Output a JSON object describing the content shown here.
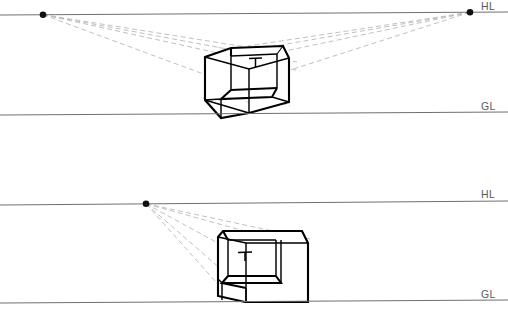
{
  "document": {
    "title": "Two-point and one-point perspective construction of a notched box",
    "background_color": "#ffffff",
    "width": 508,
    "height": 317
  },
  "style_colors": {
    "reference_line": "#6f6f6f",
    "construction_line": "#b9b9b9",
    "object_outline": "#000000",
    "vanishing_point": "#111111",
    "label_text": "#5a5a5a",
    "face_fill": "#ffffff"
  },
  "diagrams": [
    {
      "id": "two-point-perspective",
      "name": "Two-point perspective",
      "labels": {
        "horizon_line": "HL",
        "ground_line": "GL"
      },
      "horizon_line": {
        "x1": 0,
        "y1": 15,
        "x2": 508,
        "y2": 12
      },
      "ground_line": {
        "x1": 0,
        "y1": 115,
        "x2": 508,
        "y2": 112
      },
      "label_positions": {
        "horizon_line": {
          "x": 481,
          "y": 10
        },
        "ground_line": {
          "x": 481,
          "y": 110
        }
      },
      "vanishing_points": [
        {
          "name": "VPL",
          "x": 43,
          "y": 14.7
        },
        {
          "name": "VPR",
          "x": 470,
          "y": 12.3
        }
      ],
      "object": {
        "kind": "notched-box",
        "description": "Open cubic box with a rectangular notch removed from the lower front-left, drawn in two-point perspective",
        "interior_marker": "T-shaped scale figure on back wall"
      }
    },
    {
      "id": "one-point-perspective",
      "name": "One-point perspective",
      "labels": {
        "horizon_line": "HL",
        "ground_line": "GL"
      },
      "horizon_line": {
        "x1": 0,
        "y1": 205,
        "x2": 508,
        "y2": 201
      },
      "ground_line": {
        "x1": 0,
        "y1": 303,
        "x2": 508,
        "y2": 300
      },
      "label_positions": {
        "horizon_line": {
          "x": 481,
          "y": 198
        },
        "ground_line": {
          "x": 481,
          "y": 298
        }
      },
      "vanishing_points": [
        {
          "name": "VP",
          "x": 146,
          "y": 203.8
        }
      ],
      "object": {
        "kind": "notched-box",
        "description": "Open rectangular box with a notch removed from the lower front, drawn in one-point perspective",
        "interior_marker": "T-shaped scale figure on back wall"
      }
    }
  ]
}
